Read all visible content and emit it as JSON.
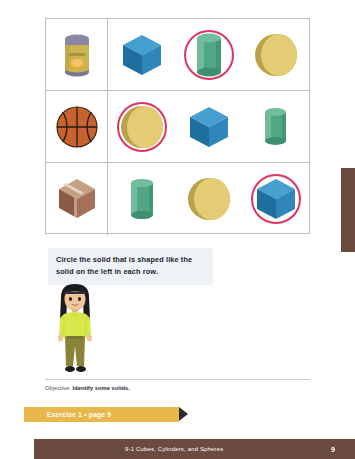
{
  "page": {
    "footer_title": "9-1  Cubes, Cylinders, and Spheres",
    "footer_page_number": "9"
  },
  "instruction": {
    "text": "Circle the solid that is shaped like the solid on the left in each row."
  },
  "objective": {
    "prefix": "Objective:",
    "text": "Identify some solids."
  },
  "exercise_banner": {
    "label": "Exercise 1 • page 9"
  },
  "colors": {
    "circle_mark": "#e0335f",
    "banner": "#e8b84b",
    "footer": "#6b4a40",
    "cube": "#2f8cc0",
    "cylinder": "#4fa883",
    "sphere": "#e2cc76",
    "bubble": "#eef2f6"
  },
  "table": {
    "rows": [
      {
        "prompt": {
          "name": "soup-can",
          "shape": "cylinder",
          "alt": "Soup can"
        },
        "options": [
          {
            "shape": "cube",
            "circled": false
          },
          {
            "shape": "cylinder",
            "circled": true
          },
          {
            "shape": "sphere",
            "circled": false
          }
        ]
      },
      {
        "prompt": {
          "name": "basketball",
          "shape": "sphere",
          "alt": "Basketball"
        },
        "options": [
          {
            "shape": "sphere",
            "circled": true
          },
          {
            "shape": "cube",
            "circled": false
          },
          {
            "shape": "cylinder",
            "circled": false
          }
        ]
      },
      {
        "prompt": {
          "name": "cardboard-box",
          "shape": "cube",
          "alt": "Cardboard box"
        },
        "options": [
          {
            "shape": "cylinder",
            "circled": false
          },
          {
            "shape": "sphere",
            "circled": false
          },
          {
            "shape": "cube",
            "circled": true
          }
        ]
      }
    ]
  }
}
